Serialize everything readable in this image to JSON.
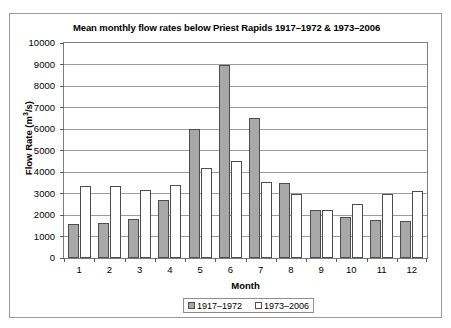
{
  "chart_data": {
    "type": "bar",
    "title": "Mean monthly flow rates below Priest Rapids 1917–1972 & 1973–2006",
    "xlabel": "Month",
    "ylabel": "Flow Rate (m³/s)",
    "ylabel_base": "Flow Rate (m",
    "ylabel_sup": "3",
    "ylabel_tail": "/s)",
    "categories": [
      "1",
      "2",
      "3",
      "4",
      "5",
      "6",
      "7",
      "8",
      "9",
      "10",
      "11",
      "12"
    ],
    "ylim": [
      0,
      10000
    ],
    "ytick_labels": [
      "10000",
      "9000",
      "8000",
      "7000",
      "6000",
      "5000",
      "4000",
      "3000",
      "2000",
      "1000",
      "0"
    ],
    "ytick_values": [
      10000,
      9000,
      8000,
      7000,
      6000,
      5000,
      4000,
      3000,
      2000,
      1000,
      0
    ],
    "grid": true,
    "legend_position": "bottom-center",
    "series": [
      {
        "name": "1917–1972",
        "color": "#a8a8a8",
        "values": [
          1600,
          1650,
          1800,
          2700,
          6000,
          9000,
          6500,
          3500,
          2250,
          1900,
          1750,
          1700
        ]
      },
      {
        "name": "1973–2006",
        "color": "#ffffff",
        "values": [
          3350,
          3350,
          3150,
          3400,
          4200,
          4500,
          3550,
          3000,
          2250,
          2500,
          3000,
          3100
        ]
      }
    ]
  },
  "legend": {
    "items": [
      {
        "label": "1917–1972",
        "swatch": "old"
      },
      {
        "label": "1973–2006",
        "swatch": "newr"
      }
    ]
  }
}
